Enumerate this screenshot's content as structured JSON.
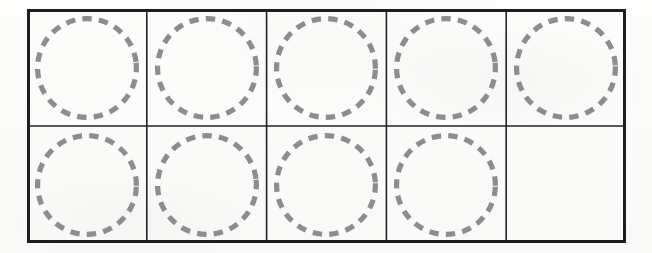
{
  "worksheet": {
    "kind": "ten-frame",
    "title": "Ten Frame",
    "rows": 2,
    "columns": 5,
    "total_cells": 10,
    "filled_cells": 9,
    "empty_cells": 1,
    "colors": {
      "background": "#fcfcfb",
      "frame_border": "#1e1e1e",
      "grid_line": "#232323",
      "circle_dash": "#8d8d8d"
    },
    "geometry": {
      "frame_x": 27,
      "frame_y": 9,
      "frame_width": 599,
      "frame_height": 234,
      "outer_border_width": 3,
      "inner_line_width": 1.6,
      "circle_diameter": 104,
      "circle_stroke_width": 5,
      "circle_dash_length": 9,
      "circle_dash_gap": 7
    },
    "cells": [
      {
        "id": "r1c1",
        "row": 1,
        "column": 1,
        "has_circle": true,
        "label": "cell-row1-col1"
      },
      {
        "id": "r1c2",
        "row": 1,
        "column": 2,
        "has_circle": true,
        "label": "cell-row1-col2"
      },
      {
        "id": "r1c3",
        "row": 1,
        "column": 3,
        "has_circle": true,
        "label": "cell-row1-col3"
      },
      {
        "id": "r1c4",
        "row": 1,
        "column": 4,
        "has_circle": true,
        "label": "cell-row1-col4"
      },
      {
        "id": "r1c5",
        "row": 1,
        "column": 5,
        "has_circle": true,
        "label": "cell-row1-col5"
      },
      {
        "id": "r2c1",
        "row": 2,
        "column": 1,
        "has_circle": true,
        "label": "cell-row2-col1"
      },
      {
        "id": "r2c2",
        "row": 2,
        "column": 2,
        "has_circle": true,
        "label": "cell-row2-col2"
      },
      {
        "id": "r2c3",
        "row": 2,
        "column": 3,
        "has_circle": true,
        "label": "cell-row2-col3"
      },
      {
        "id": "r2c4",
        "row": 2,
        "column": 4,
        "has_circle": true,
        "label": "cell-row2-col4"
      },
      {
        "id": "r2c5",
        "row": 2,
        "column": 5,
        "has_circle": false,
        "label": "cell-row2-col5"
      }
    ]
  }
}
